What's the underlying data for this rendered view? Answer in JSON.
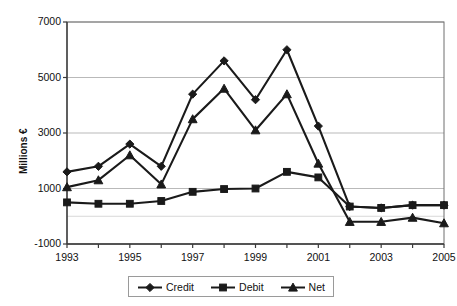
{
  "chart_data": {
    "type": "line",
    "title": "",
    "xlabel": "",
    "ylabel": "Millions €",
    "ylim": [
      -1000,
      7000
    ],
    "yticks": [
      -1000,
      1000,
      3000,
      5000,
      7000
    ],
    "ytick_labels": [
      "-1000",
      "1000",
      "3000",
      "5000",
      "7000"
    ],
    "grid": true,
    "grid_axis": "y",
    "legend_position": "bottom",
    "x": [
      1993,
      1994,
      1995,
      1996,
      1997,
      1998,
      1999,
      2000,
      2001,
      2002,
      2003,
      2004,
      2005
    ],
    "categories": [
      "1993",
      "1994",
      "1995",
      "1996",
      "1997",
      "1998",
      "1999",
      "2000",
      "2001",
      "2002",
      "2003",
      "2004",
      "2005"
    ],
    "xtick_labels_shown": [
      "1993",
      "1995",
      "1997",
      "1999",
      "2001",
      "2003",
      "2005"
    ],
    "series": [
      {
        "name": "Credit",
        "marker": "diamond",
        "color": "#1a1a1a",
        "values": [
          1600,
          1800,
          2600,
          1800,
          4400,
          5600,
          4200,
          6000,
          3250,
          350,
          300,
          400,
          400
        ]
      },
      {
        "name": "Debit",
        "marker": "square",
        "color": "#1a1a1a",
        "values": [
          500,
          450,
          450,
          550,
          880,
          980,
          1000,
          1600,
          1400,
          350,
          300,
          400,
          400
        ]
      },
      {
        "name": "Net",
        "marker": "triangle",
        "color": "#1a1a1a",
        "values": [
          1050,
          1300,
          2200,
          1150,
          3500,
          4600,
          3100,
          4400,
          1900,
          -200,
          -200,
          -50,
          -250
        ]
      }
    ]
  },
  "legend": {
    "items": [
      {
        "label": "Credit",
        "marker": "diamond"
      },
      {
        "label": "Debit",
        "marker": "square"
      },
      {
        "label": "Net",
        "marker": "triangle"
      }
    ]
  },
  "axes": {
    "y_title": "Millions €"
  }
}
